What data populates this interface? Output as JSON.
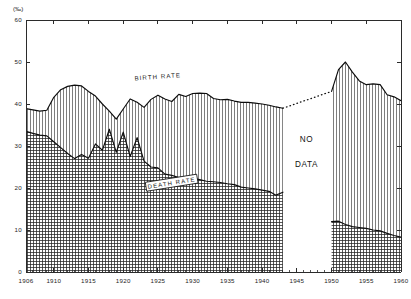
{
  "chart_data": {
    "type": "area",
    "title": "",
    "subtitle": "",
    "unit_label": "(‰)",
    "xlabel": "",
    "ylabel": "",
    "xlim": [
      1906,
      1960
    ],
    "ylim": [
      0,
      60
    ],
    "grid": true,
    "legend_position": "inline-annotations",
    "y_ticks": [
      0,
      10,
      20,
      30,
      40,
      50,
      60
    ],
    "x_ticks": [
      1906,
      1910,
      1915,
      1920,
      1925,
      1930,
      1935,
      1940,
      1945,
      1950,
      1955,
      1960
    ],
    "x_minor_tick_step": 1,
    "annotations": [
      {
        "name": "birth-rate-label",
        "text": "BIRTH    RATE",
        "x": 1925,
        "y": 46
      },
      {
        "name": "death-rate-label",
        "text": "DEATH  RATE",
        "x": 1927,
        "y": 21
      },
      {
        "name": "no-data-label-line1",
        "text": "NO",
        "x": 1946.4,
        "y": 31
      },
      {
        "name": "no-data-label-line2",
        "text": "DATA",
        "x": 1946.4,
        "y": 25
      }
    ],
    "gap": {
      "start": 1943,
      "end": 1950,
      "label": "NO DATA"
    },
    "series": [
      {
        "name": "BIRTH RATE",
        "fill_pattern": "vertical-hatch",
        "x": [
          1906,
          1907,
          1908,
          1909,
          1910,
          1911,
          1912,
          1913,
          1914,
          1915,
          1916,
          1917,
          1918,
          1919,
          1920,
          1921,
          1922,
          1923,
          1924,
          1925,
          1926,
          1927,
          1928,
          1929,
          1930,
          1931,
          1932,
          1933,
          1934,
          1935,
          1936,
          1937,
          1938,
          1939,
          1940,
          1941,
          1942,
          1943
        ],
        "values": [
          38.9,
          38.6,
          38.3,
          38.5,
          41.6,
          43.4,
          44.2,
          44.5,
          44.3,
          43.0,
          41.9,
          40.0,
          38.3,
          36.4,
          38.8,
          41.2,
          40.4,
          39.2,
          41.1,
          42.1,
          41.2,
          40.6,
          42.3,
          41.8,
          42.5,
          42.6,
          42.5,
          41.3,
          41.0,
          41.1,
          40.7,
          40.4,
          40.4,
          40.2,
          40.0,
          39.7,
          39.3,
          39.0
        ],
        "units": "per 1000 population"
      },
      {
        "name": "BIRTH RATE (post-war)",
        "fill_pattern": "vertical-hatch",
        "x": [
          1950,
          1951,
          1952,
          1953,
          1954,
          1955,
          1956,
          1957,
          1958,
          1959,
          1960
        ],
        "values": [
          43.0,
          48.2,
          50.0,
          47.6,
          45.5,
          44.6,
          44.8,
          44.6,
          42.2,
          41.7,
          40.8
        ],
        "units": "per 1000 population"
      },
      {
        "name": "DEATH RATE",
        "fill_pattern": "cross-hatch",
        "x": [
          1906,
          1907,
          1908,
          1909,
          1910,
          1911,
          1912,
          1913,
          1914,
          1915,
          1916,
          1917,
          1918,
          1919,
          1920,
          1921,
          1922,
          1923,
          1924,
          1925,
          1926,
          1927,
          1928,
          1929,
          1930,
          1931,
          1932,
          1933,
          1934,
          1935,
          1936,
          1937,
          1938,
          1939,
          1940,
          1941,
          1942,
          1943
        ],
        "values": [
          33.5,
          33.0,
          32.6,
          32.4,
          31.0,
          29.6,
          28.2,
          27.0,
          28.0,
          27.1,
          30.5,
          29.0,
          34.0,
          28.5,
          33.3,
          27.5,
          32.0,
          26.4,
          25.0,
          24.8,
          23.3,
          23.0,
          22.5,
          22.6,
          22.3,
          22.0,
          21.6,
          21.5,
          21.3,
          21.0,
          20.8,
          20.2,
          20.0,
          19.8,
          19.5,
          19.2,
          18.3,
          19.0
        ],
        "units": "per 1000 population"
      },
      {
        "name": "DEATH RATE (post-war)",
        "fill_pattern": "cross-hatch",
        "x": [
          1950,
          1951,
          1952,
          1953,
          1954,
          1955,
          1956,
          1957,
          1958,
          1959,
          1960
        ],
        "values": [
          12.0,
          12.1,
          11.3,
          10.8,
          10.6,
          10.4,
          10.0,
          9.8,
          9.2,
          8.7,
          8.3
        ],
        "units": "per 1000 population"
      }
    ],
    "connector": {
      "name": "birth-rate-gap-connector",
      "style": "dotted",
      "x": [
        1943,
        1950
      ],
      "values": [
        39.0,
        43.0
      ]
    }
  }
}
